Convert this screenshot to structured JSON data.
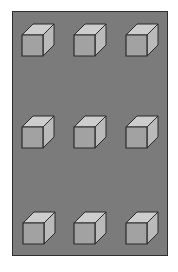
{
  "figure": {
    "rows": 3,
    "columns": 3,
    "colors": {
      "page_background": "#ffffff",
      "panel_fill": "#7b7b7b",
      "panel_border": "#2e2e2e",
      "cube_top": "#cdcdcd",
      "cube_front": "#a2a2a2",
      "cube_side": "#bababa",
      "cube_edge": "#2a2a2a"
    },
    "cubes": [
      {
        "row": 1,
        "col": 1,
        "x": 22,
        "y": 35
      },
      {
        "row": 1,
        "col": 2,
        "x": 74,
        "y": 35
      },
      {
        "row": 1,
        "col": 3,
        "x": 126,
        "y": 35
      },
      {
        "row": 2,
        "col": 1,
        "x": 22,
        "y": 127
      },
      {
        "row": 2,
        "col": 2,
        "x": 74,
        "y": 127
      },
      {
        "row": 2,
        "col": 3,
        "x": 126,
        "y": 127
      },
      {
        "row": 3,
        "col": 1,
        "x": 23,
        "y": 223
      },
      {
        "row": 3,
        "col": 2,
        "x": 74,
        "y": 223
      },
      {
        "row": 3,
        "col": 3,
        "x": 126,
        "y": 223
      }
    ],
    "cube_size": 21,
    "cube_depth": 11
  }
}
